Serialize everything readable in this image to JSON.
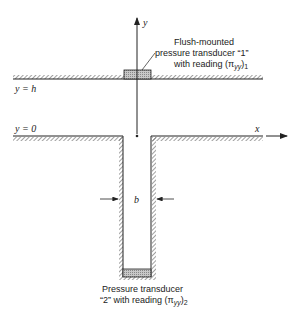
{
  "diagram": {
    "axes": {
      "y_label": "y",
      "x_label": "x"
    },
    "walls": {
      "upper_label": "y = h",
      "lower_label": "y = 0"
    },
    "slot": {
      "width_label": "b"
    },
    "transducer_1": {
      "line1": "Flush-mounted",
      "line2": "pressure transducer “1”",
      "line3_prefix": "with reading (π",
      "line3_sub": "yy",
      "line3_suffix": ")",
      "index": "1"
    },
    "transducer_2": {
      "line1": "Pressure transducer",
      "line2_prefix": "“2” with reading (π",
      "line2_sub": "yy",
      "line2_suffix": ")",
      "index": "2"
    },
    "colors": {
      "line": "#222222",
      "hatch": "#444444",
      "transducer_fill": "#b5b5b5"
    }
  }
}
